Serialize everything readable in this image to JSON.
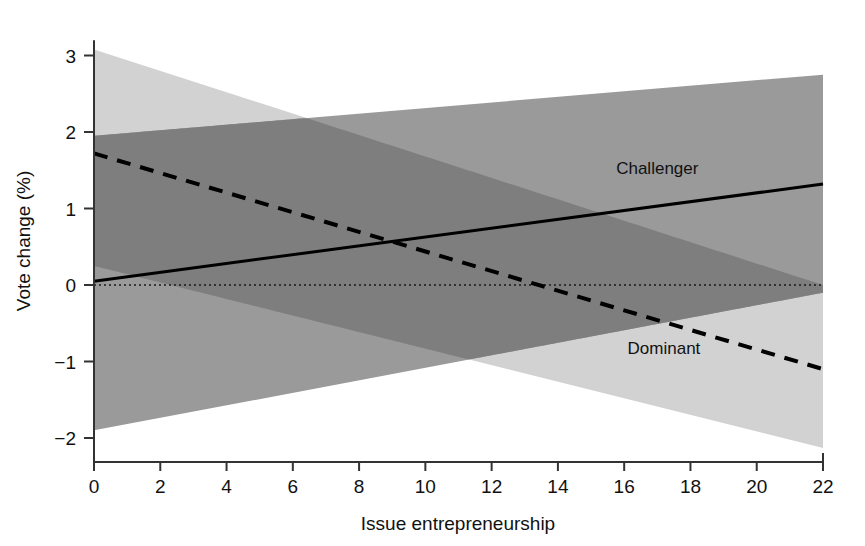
{
  "chart_data": {
    "type": "line",
    "title": "",
    "xlabel": "Issue entrepreneurship",
    "ylabel": "Vote change (%)",
    "xlim": [
      0,
      22
    ],
    "ylim": [
      -2,
      3.2
    ],
    "xticks": [
      0,
      2,
      4,
      6,
      8,
      10,
      12,
      14,
      16,
      18,
      20,
      22
    ],
    "yticks": [
      3,
      2,
      1,
      0,
      -1,
      -2
    ],
    "xtick_labels": [
      "0",
      "2",
      "4",
      "6",
      "8",
      "10",
      "12",
      "14",
      "16",
      "18",
      "20",
      "22"
    ],
    "ytick_labels": [
      "3",
      "2",
      "1",
      "0",
      "−1",
      "−2"
    ],
    "grid": false,
    "legend_position": "inline-annotations",
    "zero_reference_line": 0,
    "series": [
      {
        "name": "Challenger",
        "style": "solid",
        "color": "#000000",
        "band_color": "#9a9a9a",
        "x": [
          0,
          22
        ],
        "values": [
          0.05,
          1.32
        ],
        "ci_lower": [
          -1.9,
          -0.1
        ],
        "ci_upper": [
          1.95,
          2.75
        ],
        "label_x": 17.0,
        "label_y": 1.45
      },
      {
        "name": "Dominant",
        "style": "dashed",
        "color": "#000000",
        "band_color": "#d2d2d2",
        "x": [
          0,
          22
        ],
        "values": [
          1.72,
          -1.1
        ],
        "ci_lower": [
          0.25,
          -2.13
        ],
        "ci_upper": [
          3.08,
          0.0
        ],
        "label_x": 17.2,
        "label_y": -0.9
      }
    ],
    "annotations": [
      {
        "text": "Challenger",
        "x": 17.0,
        "y": 1.45
      },
      {
        "text": "Dominant",
        "x": 17.2,
        "y": -0.9
      }
    ]
  },
  "colors": {
    "background": "#ffffff",
    "axis": "#333333",
    "text": "#111111",
    "challenger_band": "#9a9a9a",
    "dominant_band": "#d2d2d2",
    "overlap_band": "#7e7e7e",
    "line": "#000000"
  }
}
